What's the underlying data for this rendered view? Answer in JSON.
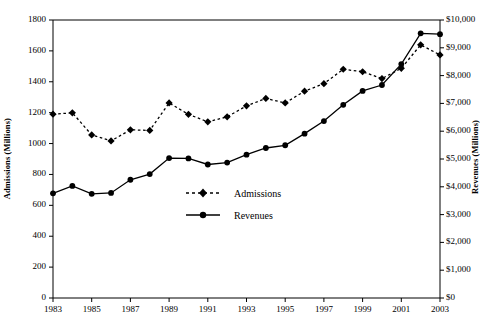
{
  "chart_data": {
    "type": "line",
    "title": "",
    "xlabel": "",
    "ylabel": "Admissions (Millions)",
    "y2label": "Revenues (Millions)",
    "grid": false,
    "legend_position": "center",
    "x": [
      1983,
      1984,
      1985,
      1986,
      1987,
      1988,
      1989,
      1990,
      1991,
      1992,
      1993,
      1994,
      1995,
      1996,
      1997,
      1998,
      1999,
      2000,
      2001,
      2002,
      2003
    ],
    "xtick_labels": [
      "1983",
      "1985",
      "1987",
      "1989",
      "1991",
      "1993",
      "1995",
      "1997",
      "1999",
      "2001",
      "2003"
    ],
    "xtick_values": [
      1983,
      1985,
      1987,
      1989,
      1991,
      1993,
      1995,
      1997,
      1999,
      2001,
      2003
    ],
    "xlim": [
      1983,
      2003
    ],
    "ylim": [
      0,
      1800
    ],
    "ytick_labels": [
      "0",
      "200",
      "400",
      "600",
      "800",
      "1000",
      "1200",
      "1400",
      "1600",
      "1800"
    ],
    "ytick_values": [
      0,
      200,
      400,
      600,
      800,
      1000,
      1200,
      1400,
      1600,
      1800
    ],
    "y2lim": [
      0,
      10000
    ],
    "y2tick_labels": [
      "$0",
      "$1,000",
      "$2,000",
      "$3,000",
      "$4,000",
      "$5,000",
      "$6,000",
      "$7,000",
      "$8,000",
      "$9,000",
      "$10,000"
    ],
    "y2tick_values": [
      0,
      1000,
      2000,
      3000,
      4000,
      5000,
      6000,
      7000,
      8000,
      9000,
      10000
    ],
    "series": [
      {
        "name": "Admissions",
        "axis": "left",
        "marker": "diamond",
        "linestyle": "dashed",
        "color": "#000000",
        "values": [
          1190,
          1199,
          1056,
          1017,
          1089,
          1085,
          1263,
          1189,
          1141,
          1173,
          1244,
          1292,
          1263,
          1339,
          1388,
          1481,
          1465,
          1421,
          1487,
          1639,
          1574
        ]
      },
      {
        "name": "Revenues",
        "axis": "right",
        "marker": "circle",
        "linestyle": "solid",
        "color": "#000000",
        "values": [
          3766,
          4031,
          3749,
          3778,
          4253,
          4458,
          5033,
          5022,
          4803,
          4871,
          5154,
          5396,
          5494,
          5912,
          6366,
          6949,
          7448,
          7661,
          8413,
          9520,
          9489
        ]
      }
    ]
  },
  "legend": {
    "items": [
      {
        "label": "Admissions"
      },
      {
        "label": "Revenues"
      }
    ]
  }
}
